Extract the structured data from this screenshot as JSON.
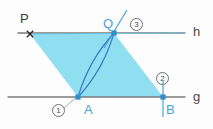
{
  "figure": {
    "canvas": {
      "width": 213,
      "height": 129,
      "background": "#fdfdfd"
    },
    "colors": {
      "fill": "#8addf0",
      "fill_opacity": "0.95",
      "construction_line": "#3f9bd4",
      "arc": "#3f79c6",
      "base_line": "#7a7a7a",
      "point_marker": "#2e8fd0",
      "label_dark": "#3b3b3b",
      "label_blue": "#4aa3d8",
      "badge_border": "#6f6f6f"
    },
    "lines": [
      {
        "name": "h",
        "label": "h",
        "label_x": 193,
        "label_y": 25,
        "y": 33,
        "x1": 18,
        "x2": 185,
        "role": "upper-parallel-line"
      },
      {
        "name": "g",
        "label": "g",
        "label_x": 193,
        "label_y": 90,
        "y": 97,
        "x1": 8,
        "x2": 185,
        "role": "lower-parallel-line"
      }
    ],
    "points": [
      {
        "id": "P",
        "label": "P",
        "x": 30,
        "y": 34,
        "label_x": 20,
        "label_y": 12,
        "marker": "cross",
        "color": "#3b3b3b"
      },
      {
        "id": "Q",
        "label": "Q",
        "x": 114,
        "y": 33,
        "label_x": 103,
        "label_y": 17,
        "marker": "square",
        "color": "#4aa3d8"
      },
      {
        "id": "A",
        "label": "A",
        "x": 78,
        "y": 97,
        "label_x": 84,
        "label_y": 103,
        "marker": "square",
        "color": "#4aa3d8"
      },
      {
        "id": "B",
        "label": "B",
        "x": 163,
        "y": 97,
        "label_x": 166,
        "label_y": 103,
        "marker": "square",
        "color": "#4aa3d8"
      }
    ],
    "polygon": {
      "name": "parallelogram-PQBA",
      "vertices": "30,34 114,33 163,97 78,97"
    },
    "arcs": [
      {
        "name": "arc-from-A",
        "path": "M 78,97 C 86,70 100,48 114,33"
      },
      {
        "name": "arc-from-Q",
        "path": "M 78,97 C 92,82 106,60 114,33"
      }
    ],
    "construction_segments": [
      {
        "name": "perp-bisector-through-Q",
        "x1": 127,
        "y1": 10,
        "x2": 104,
        "y2": 48
      },
      {
        "name": "vertical-through-B",
        "x1": 163,
        "y1": 81,
        "x2": 163,
        "y2": 117
      },
      {
        "name": "leader-to-A",
        "x1": 64,
        "y1": 108,
        "x2": 80,
        "y2": 94
      }
    ],
    "steps": [
      {
        "id": "1",
        "label": "1",
        "x": 52,
        "y": 104,
        "for": "A"
      },
      {
        "id": "2",
        "label": "2",
        "x": 156,
        "y": 72,
        "for": "B"
      },
      {
        "id": "3",
        "label": "3",
        "x": 130,
        "y": 18,
        "for": "Q"
      }
    ]
  }
}
